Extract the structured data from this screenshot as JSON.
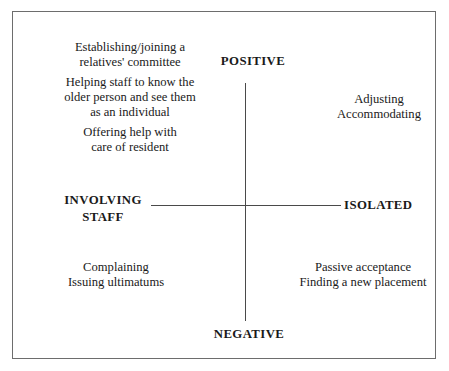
{
  "diagram": {
    "type": "two-axis-quadrant-matrix",
    "axes": {
      "vertical": {
        "top_label": "POSITIVE",
        "bottom_label": "NEGATIVE"
      },
      "horizontal": {
        "left_label_lines": [
          "INVOLVING",
          "STAFF"
        ],
        "right_label": "ISOLATED"
      }
    },
    "quadrants": {
      "involving_positive": {
        "paragraphs": [
          [
            "Establishing/joining a",
            "relatives' committee"
          ],
          [
            "Helping staff to know the",
            "older person and see them",
            "as an individual"
          ],
          [
            "Offering help with",
            "care of resident"
          ]
        ]
      },
      "isolated_positive": {
        "lines": [
          "Adjusting",
          "Accommodating"
        ]
      },
      "involving_negative": {
        "lines": [
          "Complaining",
          "Issuing ultimatums"
        ]
      },
      "isolated_negative": {
        "lines": [
          "Passive acceptance",
          "Finding a new placement"
        ]
      }
    },
    "colors": {
      "background": "#ffffff",
      "text": "#1a1a1a",
      "frame_border": "#6d6d6d",
      "axis_line": "#4a4a4a"
    }
  }
}
